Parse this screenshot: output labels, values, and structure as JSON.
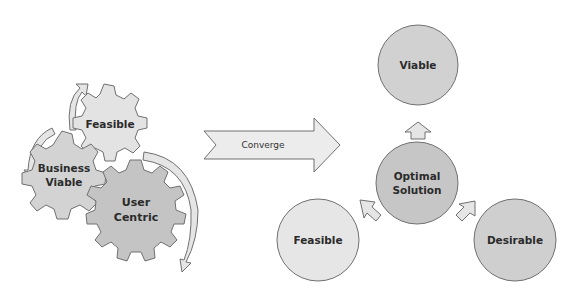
{
  "left_group": {
    "gears": [
      {
        "label_lines": [
          "Feasible"
        ],
        "fill": "#e3e3e3"
      },
      {
        "label_lines": [
          "Business",
          "Viable"
        ],
        "fill": "#d3d3d3"
      },
      {
        "label_lines": [
          "User",
          "Centric"
        ],
        "fill": "#c4c4c4"
      }
    ]
  },
  "converge_arrow": {
    "label": "Converge",
    "fill": "#ececec"
  },
  "right_group": {
    "center": {
      "label_lines": [
        "Optimal",
        "Solution"
      ],
      "fill": "#c6c6c6"
    },
    "circles": [
      {
        "id": "viable",
        "label": "Viable",
        "fill": "#d1d1d1"
      },
      {
        "id": "feasible",
        "label": "Feasible",
        "fill": "#e6e6e6"
      },
      {
        "id": "desirable",
        "label": "Desirable",
        "fill": "#cfcfcf"
      }
    ]
  },
  "colors": {
    "stroke": "#707070",
    "arrow_fill": "#e5e5e5"
  }
}
